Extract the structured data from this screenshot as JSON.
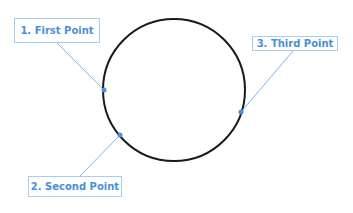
{
  "diagram": {
    "circle": {
      "cx": 174,
      "cy": 90,
      "r": 71,
      "stroke": "#1a1a1a"
    },
    "accent_color": "#4a8fd8",
    "leader_color": "#7db4ea",
    "points": [
      {
        "label": "1. First Point",
        "dot": [
          104,
          90
        ],
        "anchor": [
          57,
          43
        ]
      },
      {
        "label": "2. Second Point",
        "dot": [
          120,
          135
        ],
        "anchor": [
          80,
          176
        ]
      },
      {
        "label": "3. Third Point",
        "dot": [
          241,
          112
        ],
        "anchor": [
          293,
          51
        ]
      }
    ]
  }
}
